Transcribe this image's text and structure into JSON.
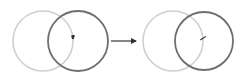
{
  "diagram": {
    "colors": {
      "background": "#ffffff",
      "light_circle": "#cfcfcf",
      "dark_circle": "#6e6e6e",
      "arrow": "#333333",
      "marker": "#333333"
    },
    "before": {
      "light_circle": {
        "cx": 43,
        "cy": 41,
        "r": 30
      },
      "dark_circle": {
        "cx": 78,
        "cy": 41,
        "r": 30
      },
      "marker": {
        "x": 73,
        "y": 37
      }
    },
    "arrow": {
      "x1": 111,
      "y1": 41,
      "x2": 136,
      "y2": 41
    },
    "after": {
      "light_circle": {
        "cx": 173,
        "cy": 41,
        "r": 30
      },
      "dark_circle": {
        "cx": 204,
        "cy": 41,
        "r": 29
      },
      "marker": {
        "x": 203,
        "y": 38
      }
    }
  }
}
